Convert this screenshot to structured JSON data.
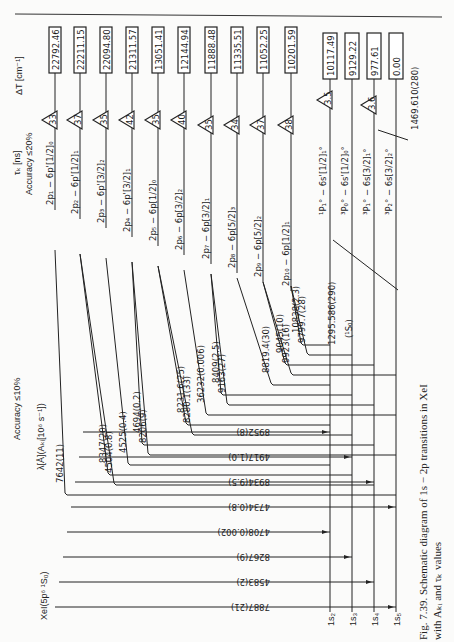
{
  "header": {
    "page_hint": "…"
  },
  "axes": {
    "delta_t_label": "ΔT [cm⁻¹]",
    "tau_label": "τₖ [ns]",
    "tau_accuracy": "Accuracy ≤20%",
    "lambda_label": "λ[Å](Aₖᵢ[10⁶ s⁻¹])",
    "lambda_accuracy": "Accuracy ≤10%",
    "ground_label": "XeI(5p⁶ ¹S₀)"
  },
  "upper_levels": [
    {
      "name": "2p₁ − 6p'[1/2]₀",
      "energy": "22792.46",
      "tau": "33",
      "x": 55
    },
    {
      "name": "2p₂ − 6p'[1/2]₁",
      "energy": "22211.15",
      "tau": "37",
      "x": 80
    },
    {
      "name": "2p₃ − 6p'[3/2]₂",
      "energy": "22094.80",
      "tau": "35",
      "x": 106
    },
    {
      "name": "2p₄ − 6p'[3/2]₁",
      "energy": "21311.57",
      "tau": "42",
      "x": 132
    },
    {
      "name": "2p₅ − 6p[1/2]₀",
      "energy": "13051.41",
      "tau": "35",
      "x": 158
    },
    {
      "name": "2p₆ − 6p[3/2]₂",
      "energy": "12144.94",
      "tau": "40",
      "x": 184
    },
    {
      "name": "2p₇ − 6p[3/2]₁",
      "energy": "11888.48",
      "tau": "35",
      "x": 211
    },
    {
      "name": "2p₈ − 6p[5/2]₃",
      "energy": "11335.51",
      "tau": "34",
      "x": 237
    },
    {
      "name": "2p₉ − 6p[5/2]₂",
      "energy": "11052.25",
      "tau": "37",
      "x": 263
    },
    {
      "name": "2p₁₀ − 6p[1/2]₁",
      "energy": "10201.59",
      "tau": "38",
      "x": 291
    }
  ],
  "lower_levels": [
    {
      "name": "¹P₁° − 6s'[1/2]₁°",
      "energy": "10117.49",
      "tau": "3.5",
      "label": "1s₂",
      "x": 330
    },
    {
      "name": "³P₀° − 6s'[1/2]₀°",
      "energy": "9129.22",
      "tau": "",
      "label": "1s₃",
      "x": 352
    },
    {
      "name": "³P₁° − 6s[3/2]₁°",
      "energy": "977.61",
      "tau": "3.6",
      "label": "1s₄",
      "x": 374
    },
    {
      "name": "³P₂° − 6s[3/2]₂°",
      "energy": "0.00",
      "tau": "",
      "label": "1s₅",
      "x": 396
    }
  ],
  "resonance_lines": [
    {
      "label": "1295.586(290)",
      "sublabel": "(¹S₀)"
    },
    {
      "label": "1469.610(280)"
    }
  ],
  "transitions_upper": [
    "10838(2.3)",
    "9799.7(28)",
    "9045(10)",
    "9923(16)",
    "8819.4(30)",
    "8409(2.5)",
    "9163(27)",
    "36232(0.006)",
    "8231.6(25)",
    "8280.1(33)",
    "4694(0.2)",
    "8206(9)",
    "4525(0.4)",
    "8347(20)",
    "4504(0.8)",
    "7642(11)"
  ],
  "transitions_lower": [
    "8952(8)",
    "4917(1.0)",
    "8934(9.5)",
    "4734(0.8)",
    "4708(0.002)",
    "8267(9)",
    "4583(2)",
    "7887(21)"
  ],
  "caption": {
    "line1": "Fig. 7.39. Schematic diagram of 1s − 2p transitions in XeI",
    "line2": "with Aₖᵢ and τₖ values"
  }
}
